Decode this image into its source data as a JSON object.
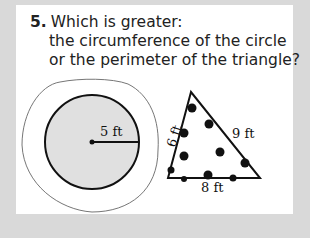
{
  "question": {
    "number": "5.",
    "lines": [
      "Which is greater:",
      "the circumference of the circle",
      "or the perimeter of the triangle?"
    ]
  },
  "circle": {
    "radius_label": "5 ft",
    "fill": "#e0e0e0"
  },
  "triangle": {
    "left_side_label": "6 ft",
    "right_side_label": "9 ft",
    "bottom_side_label": "8 ft"
  },
  "colors": {
    "frame": "#d9d9d9",
    "card": "#ffffff",
    "ink": "#111111"
  }
}
